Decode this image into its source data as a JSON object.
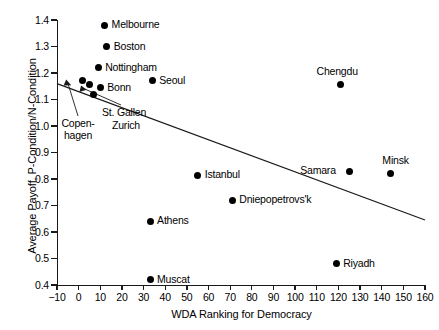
{
  "chart_data": {
    "type": "scatter",
    "title": "",
    "xlabel": "WDA Ranking for Democracy",
    "ylabel": "Average Payoff, P-Condition/N-Condition",
    "xlim": [
      -10,
      160
    ],
    "ylim": [
      0.4,
      1.4
    ],
    "xticks": [
      "-10",
      "0",
      "10",
      "20",
      "30",
      "40",
      "50",
      "60",
      "70",
      "80",
      "90",
      "100",
      "110",
      "120",
      "130",
      "140",
      "150",
      "160"
    ],
    "xtick_values": [
      -10,
      0,
      10,
      20,
      30,
      40,
      50,
      60,
      70,
      80,
      90,
      100,
      110,
      120,
      130,
      140,
      150,
      160
    ],
    "yticks": [
      "0.4",
      "0.5",
      "0.6",
      "0.7",
      "0.8",
      "0.9",
      "1.0",
      "1.1",
      "1.2",
      "1.3",
      "1.4"
    ],
    "ytick_values": [
      0.4,
      0.5,
      0.6,
      0.7,
      0.8,
      0.9,
      1.0,
      1.1,
      1.2,
      1.3,
      1.4
    ],
    "grid": false,
    "legend": null,
    "marker": "filled-circle",
    "points": [
      {
        "label": "Melbourne",
        "x": 12,
        "y": 1.38,
        "label_pos": "right"
      },
      {
        "label": "Boston",
        "x": 13,
        "y": 1.3,
        "label_pos": "right"
      },
      {
        "label": "Nottingham",
        "x": 9,
        "y": 1.22,
        "label_pos": "right"
      },
      {
        "label": "Seoul",
        "x": 34,
        "y": 1.17,
        "label_pos": "right"
      },
      {
        "label": "Copenhagen",
        "x": 2,
        "y": 1.17,
        "label_pos": "leader"
      },
      {
        "label": "Zurich",
        "x": 5,
        "y": 1.155,
        "label_pos": "leader"
      },
      {
        "label": "St. Gallen",
        "x": 7,
        "y": 1.12,
        "label_pos": "leader"
      },
      {
        "label": "Bonn",
        "x": 10,
        "y": 1.145,
        "label_pos": "right"
      },
      {
        "label": "Chengdu",
        "x": 121,
        "y": 1.155,
        "label_pos": "above"
      },
      {
        "label": "Samara",
        "x": 125,
        "y": 0.83,
        "label_pos": "left"
      },
      {
        "label": "Minsk",
        "x": 144,
        "y": 0.82,
        "label_pos": "above-right"
      },
      {
        "label": "Istanbul",
        "x": 55,
        "y": 0.815,
        "label_pos": "right"
      },
      {
        "label": "Dniepopetrovs'k",
        "x": 71,
        "y": 0.72,
        "label_pos": "right"
      },
      {
        "label": "Athens",
        "x": 33,
        "y": 0.64,
        "label_pos": "right"
      },
      {
        "label": "Riyadh",
        "x": 119,
        "y": 0.48,
        "label_pos": "right"
      },
      {
        "label": "Muscat",
        "x": 33,
        "y": 0.42,
        "label_pos": "right"
      }
    ],
    "trendline": {
      "type": "linear-fit",
      "x_start": -10,
      "y_start": 1.16,
      "x_end": 160,
      "y_end": 0.645
    },
    "annotations": [
      {
        "text": "Copen-",
        "text2": "hagen",
        "points_to": "Copenhagen"
      },
      {
        "text": "St. Gallen",
        "text2": "Zurich",
        "points_to": "St. Gallen / Zurich"
      }
    ],
    "colors": {
      "marker": "#000000",
      "axis": "#1a1a1a",
      "trendline": "#1a1a1a",
      "background": "#ffffff"
    }
  },
  "annotation_labels": {
    "copenhagen_line1": "Copen-",
    "copenhagen_line2": "hagen",
    "stgallen": "St. Gallen",
    "zurich": "Zurich"
  }
}
